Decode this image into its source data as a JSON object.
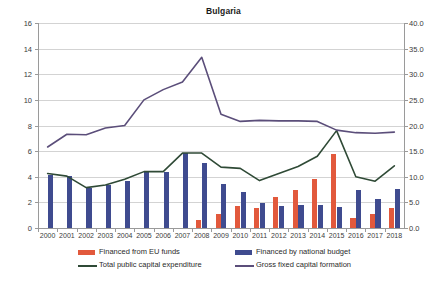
{
  "chart_data": {
    "type": "bar",
    "title": "Bulgaria",
    "subtitle": "",
    "xlabel": "",
    "ylabel": "",
    "grid": true,
    "legend_position": "bottom",
    "categories": [
      "2000",
      "2001",
      "2002",
      "2003",
      "2004",
      "2005",
      "2006",
      "2007",
      "2008",
      "2009",
      "2010",
      "2011",
      "2012",
      "2013",
      "2014",
      "2015",
      "2016",
      "2017",
      "2018"
    ],
    "axes": {
      "left": {
        "label": "",
        "min": 0,
        "max": 16,
        "step": 2,
        "ticks": [
          "0",
          "2",
          "4",
          "6",
          "8",
          "10",
          "12",
          "14",
          "16"
        ]
      },
      "right": {
        "label": "",
        "min": 0.0,
        "max": 40.0,
        "step": 5.0,
        "ticks": [
          "0.0",
          "5.0",
          "10.0",
          "15.0",
          "20.0",
          "25.0",
          "30.0",
          "35.0",
          "40.0"
        ]
      }
    },
    "series": [
      {
        "name": "Financed from EU funds",
        "type": "bar",
        "axis": "left",
        "color": "#E2593C",
        "values": [
          0,
          0,
          0,
          0,
          0,
          0,
          0,
          0,
          0.6,
          1.1,
          1.7,
          1.6,
          2.45,
          2.95,
          3.8,
          5.8,
          0.8,
          1.1,
          1.6
        ]
      },
      {
        "name": "Financed by national budget",
        "type": "bar",
        "axis": "left",
        "color": "#3F4B8F",
        "values": [
          4.15,
          4.05,
          3.1,
          3.35,
          3.65,
          4.35,
          4.4,
          5.85,
          5.1,
          3.45,
          2.8,
          1.95,
          1.75,
          1.8,
          1.8,
          1.65,
          2.95,
          2.3,
          3.05
        ]
      },
      {
        "name": "Total public capital expenditure",
        "type": "line",
        "axis": "left",
        "color": "#2F4A36",
        "values": [
          4.25,
          4.05,
          3.15,
          3.35,
          3.8,
          4.4,
          4.4,
          5.85,
          5.85,
          4.75,
          4.65,
          3.7,
          4.25,
          4.8,
          5.6,
          7.6,
          4.0,
          3.65,
          4.85
        ]
      },
      {
        "name": "Gross fixed capital formation",
        "type": "line",
        "axis": "right",
        "color": "#5B4E7A",
        "values": [
          15.8,
          18.3,
          18.2,
          19.5,
          20.0,
          25.0,
          27.0,
          28.5,
          33.3,
          22.2,
          20.8,
          21.0,
          20.9,
          20.9,
          20.8,
          19.1,
          18.6,
          18.5,
          18.7
        ]
      }
    ],
    "legend": [
      {
        "label": "Financed from EU funds",
        "marker": "bar",
        "color": "#E2593C"
      },
      {
        "label": "Financed by national budget",
        "marker": "bar",
        "color": "#3F4B8F"
      },
      {
        "label": "Total public capital expenditure",
        "marker": "line",
        "color": "#2F4A36"
      },
      {
        "label": "Gross fixed capital formation",
        "marker": "line",
        "color": "#5B4E7A"
      }
    ]
  }
}
